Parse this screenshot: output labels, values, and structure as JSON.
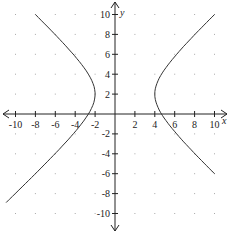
{
  "chart_data": {
    "type": "line",
    "title": "",
    "xlabel": "x",
    "ylabel": "y",
    "xlim": [
      -10,
      10
    ],
    "ylim": [
      -10,
      10
    ],
    "grid": "dots",
    "x_ticks": [
      -10,
      -8,
      -6,
      -4,
      -2,
      2,
      4,
      6,
      8,
      10
    ],
    "y_ticks": [
      10,
      8,
      6,
      4,
      2,
      -2,
      -4,
      -6,
      -8,
      -10
    ],
    "equation": "(x-1)^2/9 - (y-2)^2/8 = 1",
    "series": [
      {
        "name": "left branch",
        "points": [
          [
            -8,
            10
          ],
          [
            -6,
            7.3
          ],
          [
            -4,
            4.6
          ],
          [
            -2.5,
            2.9
          ],
          [
            -2,
            2
          ],
          [
            -2.5,
            1.1
          ],
          [
            -4,
            -0.6
          ],
          [
            -6,
            -3.3
          ],
          [
            -8,
            -6
          ],
          [
            -10,
            -8.9
          ]
        ]
      },
      {
        "name": "right branch",
        "points": [
          [
            10,
            10
          ],
          [
            8,
            7.3
          ],
          [
            6,
            4.6
          ],
          [
            4.5,
            2.9
          ],
          [
            4,
            2
          ],
          [
            4.5,
            1.1
          ],
          [
            6,
            -0.6
          ],
          [
            8,
            -3.3
          ],
          [
            10,
            -6
          ]
        ]
      }
    ],
    "curve_color": "#333333",
    "axis_color": "#222222"
  }
}
